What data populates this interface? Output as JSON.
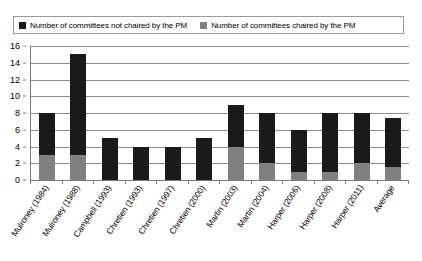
{
  "chart_data": {
    "type": "bar",
    "subtype": "stacked-vertical",
    "title": "",
    "subtitle": "",
    "xlabel": "",
    "ylabel": "",
    "ylim": [
      0,
      16
    ],
    "ytick_step": 2,
    "yticks": [
      "0",
      "2",
      "4",
      "6",
      "8",
      "10",
      "12",
      "14",
      "16"
    ],
    "grid": true,
    "grid_axis": "y",
    "legend_position": "top",
    "categories": [
      "Mulroney (1984)",
      "Mulroney (1988)",
      "Campbell (1993)",
      "Chretien (1993)",
      "Chretien (1997)",
      "Chretien (2000)",
      "Martin (2003)",
      "Martin (2004)",
      "Harper (2006)",
      "Harper (2008)",
      "Harper (2011)",
      "Average"
    ],
    "series": [
      {
        "name": "Number of committees chaired by the PM",
        "color": "#808080",
        "stack_order": 0,
        "values": [
          3,
          3,
          0,
          0,
          0,
          0,
          4,
          2,
          1,
          1,
          2,
          1.6
        ]
      },
      {
        "name": "Number of committees not chaired by the PM",
        "color": "#1a1a1a",
        "stack_order": 1,
        "values": [
          5,
          12,
          5,
          4,
          4,
          5,
          5,
          6,
          5,
          7,
          6,
          5.8
        ]
      }
    ],
    "totals": [
      8,
      15,
      5,
      4,
      4,
      5,
      9,
      8,
      6,
      8,
      8,
      7.4
    ]
  },
  "legend": {
    "entries": [
      {
        "label": "Number of committees not chaired by the PM",
        "color": "#1a1a1a",
        "swatch_name": "legend-swatch-not-chaired"
      },
      {
        "label": "Number of committees chaired by the PM",
        "color": "#808080",
        "swatch_name": "legend-swatch-chaired"
      }
    ]
  },
  "colors": {
    "not_chaired": "#1a1a1a",
    "chaired": "#808080",
    "gridline": "#8c8c8c",
    "axis": "#7d7d7d",
    "background": "#ffffff",
    "text": "#000000",
    "legend_border": "#9a9a9a"
  }
}
